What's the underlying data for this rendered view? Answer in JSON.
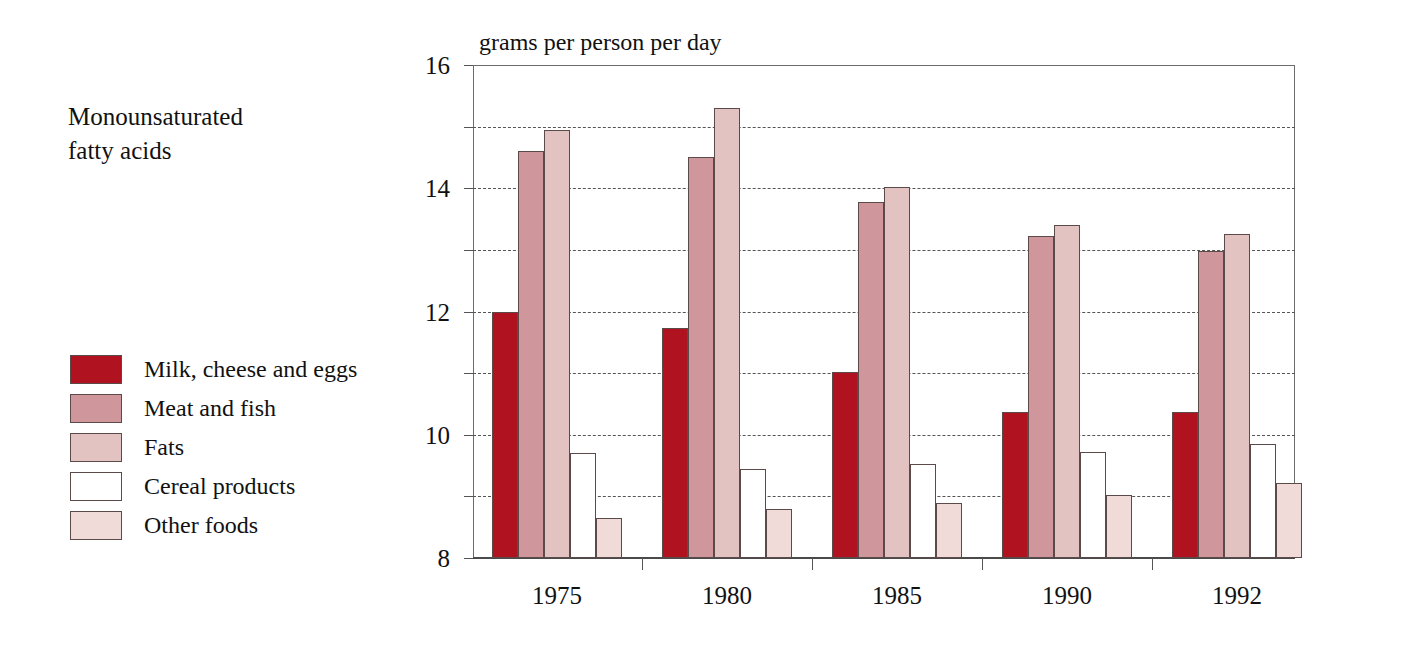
{
  "title": "Monounsaturated\nfatty acids",
  "legend": {
    "position": "left",
    "items": [
      {
        "label": "Milk, cheese and eggs",
        "color": "#b0121f"
      },
      {
        "label": "Meat and fish",
        "color": "#cf969b"
      },
      {
        "label": "Fats",
        "color": "#e3c3c2"
      },
      {
        "label": "Cereal products",
        "color": "#ffffff"
      },
      {
        "label": "Other foods",
        "color": "#f0dbd9"
      }
    ]
  },
  "chart_data": {
    "type": "bar",
    "title": "Monounsaturated fatty acids",
    "subtitle": "",
    "xlabel": "",
    "ylabel": "grams per person per day",
    "categories": [
      "1975",
      "1980",
      "1985",
      "1990",
      "1992"
    ],
    "series": [
      {
        "name": "Milk, cheese and eggs",
        "color": "#b0121f",
        "values": [
          8.0,
          7.45,
          6.05,
          4.75,
          4.75
        ]
      },
      {
        "name": "Meat and fish",
        "color": "#cf969b",
        "values": [
          13.2,
          13.0,
          11.55,
          10.45,
          9.95
        ]
      },
      {
        "name": "Fats",
        "color": "#e3c3c2",
        "values": [
          13.9,
          14.6,
          12.05,
          10.8,
          10.5
        ]
      },
      {
        "name": "Cereal products",
        "color": "#ffffff",
        "values": [
          3.4,
          2.9,
          3.05,
          3.45,
          3.7
        ]
      },
      {
        "name": "Other foods",
        "color": "#f0dbd9",
        "values": [
          1.3,
          1.6,
          1.8,
          2.05,
          2.45
        ]
      }
    ],
    "ylim": [
      0,
      16
    ],
    "yticks": [
      0,
      2,
      4,
      6,
      8,
      10,
      12,
      14,
      16
    ],
    "ytick_labels": [
      "0",
      "2",
      "4",
      "6",
      "8",
      "10",
      "12",
      "14",
      "16"
    ],
    "grid": "horizontal-dashed",
    "legend_position": "left"
  }
}
